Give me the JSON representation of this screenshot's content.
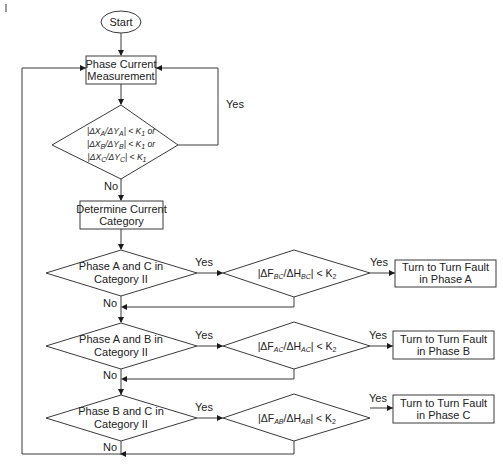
{
  "diagram": {
    "type": "flowchart",
    "start": {
      "label": "Start"
    },
    "measurement": {
      "line1": "Phase Current",
      "line2": "Measurement"
    },
    "check1": {
      "conditions": [
        {
          "pre": "|ΔX",
          "sub1": "A",
          "mid": "/ΔY",
          "sub2": "A",
          "post": "| < K",
          "k": "1",
          "tail": " or"
        },
        {
          "pre": "|ΔX",
          "sub1": "B",
          "mid": "/ΔY",
          "sub2": "B",
          "post": "| < K",
          "k": "1",
          "tail": " or"
        },
        {
          "pre": "|ΔX",
          "sub1": "C",
          "mid": "/ΔY",
          "sub2": "C",
          "post": "| < K",
          "k": "1",
          "tail": ""
        }
      ],
      "yes_label": "Yes",
      "no_label": "No"
    },
    "categorize": {
      "line1": "Determine Current",
      "line2": "Category"
    },
    "decisions": [
      {
        "line1": "Phase A and C in",
        "line2": "Category II",
        "yes_label": "Yes",
        "no_label": "No",
        "ratio": {
          "pre": "|ΔF",
          "sub1": "BC",
          "mid": "/ΔH",
          "sub2": "BC",
          "post": "| < K",
          "k": "2"
        },
        "ratio_yes_label": "Yes",
        "result": {
          "line1": "Turn to Turn Fault",
          "line2": "in Phase A"
        }
      },
      {
        "line1": "Phase A and B in",
        "line2": "Category II",
        "yes_label": "Yes",
        "no_label": "No",
        "ratio": {
          "pre": "|ΔF",
          "sub1": "AC",
          "mid": "/ΔH",
          "sub2": "AC",
          "post": "| < K",
          "k": "2"
        },
        "ratio_yes_label": "Yes",
        "result": {
          "line1": "Turn to Turn Fault",
          "line2": "in Phase B"
        }
      },
      {
        "line1": "Phase B and C in",
        "line2": "Category II",
        "yes_label": "Yes",
        "no_label": "No",
        "ratio": {
          "pre": "|ΔF",
          "sub1": "AB",
          "mid": "/ΔH",
          "sub2": "AB",
          "post": "| < K",
          "k": "2"
        },
        "ratio_yes_label": "Yes",
        "result": {
          "line1": "Turn to Turn Fault",
          "line2": "in Phase C"
        }
      }
    ],
    "colors": {
      "stroke": "#3a3a3a",
      "text": "#222222",
      "background": "#ffffff"
    }
  }
}
